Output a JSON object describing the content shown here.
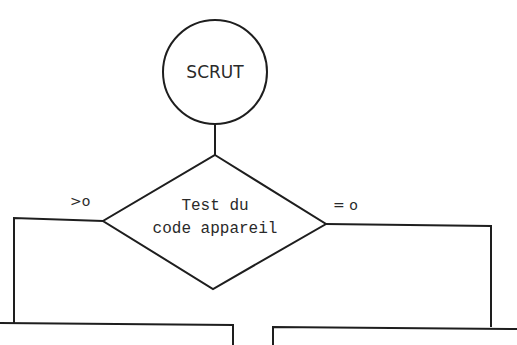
{
  "diagram": {
    "start_node": {
      "label": "SCRUT",
      "shape": "circle"
    },
    "decision_node": {
      "label_line1": "Test du",
      "label_line2": "code appareil",
      "shape": "diamond"
    },
    "branches": {
      "left": {
        "label": ">o"
      },
      "right": {
        "label": "= o"
      }
    },
    "bottom_boxes": [
      {
        "position": "left",
        "label": ""
      },
      {
        "position": "right",
        "label": ""
      }
    ],
    "colors": {
      "stroke": "#1e1e1e",
      "text": "#2a2a2a",
      "background": "#ffffff"
    }
  }
}
